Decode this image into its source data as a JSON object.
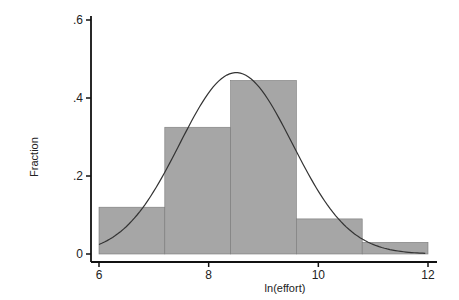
{
  "chart_data": {
    "type": "bar",
    "subtype": "histogram_with_normal_overlay",
    "title": "",
    "xlabel": "ln(effort)",
    "ylabel": "Fraction",
    "xlim": [
      6,
      12
    ],
    "ylim": [
      0,
      0.6
    ],
    "x_ticks": [
      6,
      8,
      10,
      12
    ],
    "x_tick_labels": [
      "6",
      "8",
      "10",
      "12"
    ],
    "y_ticks": [
      0,
      0.2,
      0.4,
      0.6
    ],
    "y_tick_labels": [
      "0",
      ".2",
      ".4",
      ".6"
    ],
    "grid": false,
    "legend": null,
    "bins": [
      {
        "start": 6.0,
        "end": 7.2,
        "value": 0.12
      },
      {
        "start": 7.2,
        "end": 8.4,
        "value": 0.325
      },
      {
        "start": 8.4,
        "end": 9.6,
        "value": 0.445
      },
      {
        "start": 9.6,
        "end": 10.8,
        "value": 0.09
      },
      {
        "start": 10.8,
        "end": 12.0,
        "value": 0.03
      }
    ],
    "categories": [
      "6.0-7.2",
      "7.2-8.4",
      "8.4-9.6",
      "9.6-10.8",
      "10.8-12.0"
    ],
    "values": [
      0.12,
      0.325,
      0.445,
      0.09,
      0.03
    ],
    "overlay": {
      "type": "line",
      "name": "normal density",
      "mean": 8.5,
      "sd": 1.03,
      "peak": 0.465,
      "x_range": [
        6.0,
        11.95
      ]
    },
    "colors": {
      "bar_fill": "#a6a6a6",
      "bar_edge": "#7a7a7a",
      "curve": "#333333",
      "axis": "#111111"
    }
  }
}
